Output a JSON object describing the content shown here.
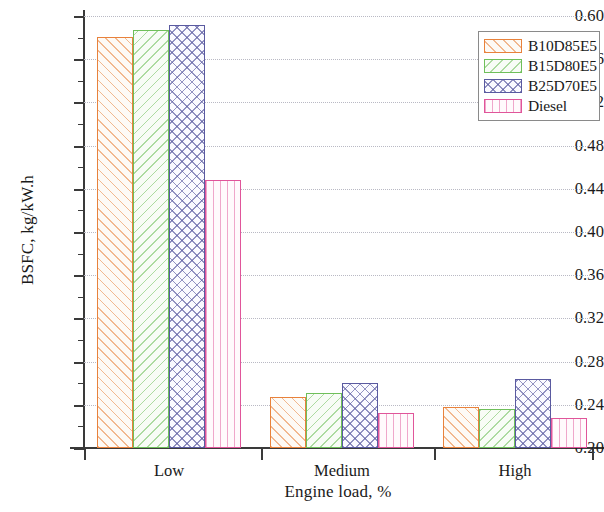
{
  "chart_data": {
    "type": "bar",
    "title": "",
    "xlabel": "Engine load, %",
    "ylabel": "BSFC, kg/kW.h",
    "categories": [
      "Low",
      "Medium",
      "High"
    ],
    "ylim": [
      0.2,
      0.6
    ],
    "ytick_step": 0.04,
    "ytick_labels": [
      "0.20",
      "0.24",
      "0.28",
      "0.32",
      "0.36",
      "0.40",
      "0.44",
      "0.48",
      "0.52",
      "0.56",
      "0.60"
    ],
    "ytick_values": [
      0.2,
      0.24,
      0.28,
      0.32,
      0.36,
      0.4,
      0.44,
      0.48,
      0.52,
      0.56,
      0.6
    ],
    "grid": true,
    "legend_position": "top-right",
    "series": [
      {
        "name": "B10D85E5",
        "color": "#E8823C",
        "pattern": "forward-hatch",
        "values": [
          0.581,
          0.247,
          0.238
        ]
      },
      {
        "name": "B15D80E5",
        "color": "#6FBF5A",
        "pattern": "backward-hatch",
        "values": [
          0.587,
          0.251,
          0.236
        ]
      },
      {
        "name": "B25D70E5",
        "color": "#5A5AA0",
        "pattern": "cross-hatch",
        "values": [
          0.592,
          0.26,
          0.264
        ]
      },
      {
        "name": "Diesel",
        "color": "#E0559A",
        "pattern": "vertical-lines",
        "values": [
          0.448,
          0.232,
          0.228
        ]
      }
    ]
  }
}
